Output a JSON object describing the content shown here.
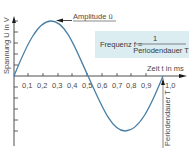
{
  "diagram": {
    "y_axis_label": "Spannung U in V",
    "x_axis_label": "Zeit t in ms",
    "x_ticks": [
      "0,1",
      "0,2",
      "0,3",
      "0,4",
      "0,5",
      "0,6",
      "0,7",
      "0,8",
      "0,9",
      "1,0"
    ],
    "amplitude_label": "Amplitude û",
    "period_label": "Periodendauer T",
    "formula": {
      "lhs": "Frequenz f =",
      "numerator": "1",
      "denominator": "Periodendauer T"
    },
    "colors": {
      "curve": "#4a7fa5",
      "axis": "#3a3a3a",
      "formula_box": "#dcedf2"
    },
    "curve": {
      "type": "sine",
      "period_ms": 1.0,
      "start_ms": 0,
      "end_ms": 1.0
    }
  }
}
